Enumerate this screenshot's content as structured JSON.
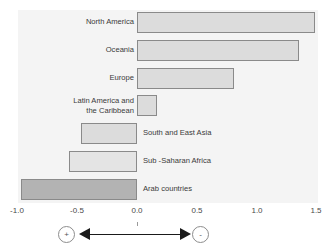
{
  "chart_data": {
    "type": "bar",
    "orientation": "horizontal",
    "title": "",
    "xlabel": "",
    "ylabel": "",
    "xlim": [
      -1.0,
      1.5
    ],
    "grid": false,
    "legend_position": "below-axis",
    "categories": [
      "North America",
      "Oceania",
      "Europe",
      "Latin America and\nthe Caribbean",
      "South and East Asia",
      "Sub -Saharan Africa",
      "Arab countries"
    ],
    "values": [
      1.49,
      1.36,
      0.81,
      0.17,
      -0.47,
      -0.57,
      -0.97
    ],
    "tick_labels": [
      "-1.0",
      "-0.5",
      "0.0",
      "0.5",
      "1.0",
      "1.5"
    ],
    "tick_values": [
      -1.0,
      -0.5,
      0.0,
      0.5,
      1.0,
      1.5
    ],
    "annotations": {
      "left_marker": "+",
      "right_marker": "-"
    }
  },
  "bars": [
    {
      "label": "North America",
      "value": 1.49,
      "label_side": "left",
      "fill": "#dcdcdc",
      "label_top": 17,
      "label_left": 42,
      "label_width": 92,
      "bar_top": 12,
      "bar_height": 21
    },
    {
      "label": "Oceania",
      "value": 1.36,
      "label_side": "left",
      "fill": "#dcdcdc",
      "label_top": 45,
      "label_left": 42,
      "label_width": 92,
      "bar_top": 40,
      "bar_height": 21
    },
    {
      "label": "Europe",
      "value": 0.81,
      "label_side": "left",
      "fill": "#dcdcdc",
      "label_top": 73,
      "label_left": 42,
      "label_width": 92,
      "bar_top": 68,
      "bar_height": 21
    },
    {
      "label": "Latin America and\nthe Caribbean",
      "value": 0.17,
      "label_side": "left",
      "fill": "#dcdcdc",
      "label_top": 96,
      "label_left": 28,
      "label_width": 106,
      "bar_top": 95,
      "bar_height": 21
    },
    {
      "label": "South and East Asia",
      "value": -0.47,
      "label_side": "right",
      "fill": "#dcdcdc",
      "label_top": 128,
      "label_left": 143,
      "label_width": 120,
      "bar_top": 123,
      "bar_height": 21
    },
    {
      "label": "Sub -Saharan Africa",
      "value": -0.57,
      "label_side": "right",
      "fill": "#e4e4e4",
      "label_top": 156,
      "label_left": 143,
      "label_width": 120,
      "bar_top": 151,
      "bar_height": 21
    },
    {
      "label": "Arab countries",
      "value": -0.97,
      "label_side": "right",
      "fill": "#b3b3b3",
      "label_top": 184,
      "label_left": 143,
      "label_width": 120,
      "bar_top": 179,
      "bar_height": 21
    }
  ],
  "axis": {
    "ticks": [
      {
        "label": "-1.0",
        "value": -1.0,
        "x": 17
      },
      {
        "label": "-0.5",
        "value": -0.5,
        "x": 77
      },
      {
        "label": "0.0",
        "value": 0.0,
        "x": 137
      },
      {
        "label": "0.5",
        "value": 0.5,
        "x": 197
      },
      {
        "label": "1.0",
        "value": 1.0,
        "x": 257
      },
      {
        "label": "1.5",
        "value": 1.5,
        "x": 316
      }
    ]
  },
  "legend": {
    "positive_marker": "+",
    "negative_marker": "-"
  }
}
